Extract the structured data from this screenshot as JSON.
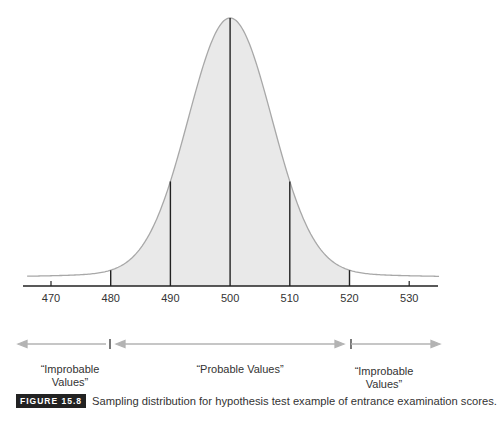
{
  "chart_data": {
    "type": "area",
    "title": "",
    "xlabel": "",
    "ylabel": "",
    "x_ticks": [
      470,
      480,
      490,
      500,
      510,
      520,
      530
    ],
    "xlim": [
      465,
      535
    ],
    "mean": 500,
    "std_error": 7,
    "vertical_lines_at": [
      480,
      490,
      500,
      510,
      520
    ],
    "shaded_range": [
      480,
      520
    ],
    "grid": false,
    "regions": [
      {
        "label": "“Improbable Values”",
        "range": [
          null,
          480
        ]
      },
      {
        "label": "“Probable Values”",
        "range": [
          480,
          520
        ]
      },
      {
        "label": "“Improbable Values”",
        "range": [
          520,
          null
        ]
      }
    ],
    "colors": {
      "shade": "#e8e8e8",
      "curve": "#a8a8a8",
      "lines": "#222222",
      "arrows": "#b0b0b0"
    }
  },
  "regions": {
    "left_line1": "“Improbable",
    "left_line2": "Values”",
    "middle": "“Probable Values”",
    "right_line1": "“Improbable",
    "right_line2": "Values”"
  },
  "caption": {
    "figure_label": "FIGURE 15.8",
    "text": "Sampling distribution for hypothesis test example of entrance examination scores."
  }
}
